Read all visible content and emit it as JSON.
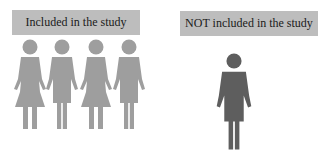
{
  "included": {
    "label": "Included in the study",
    "count": 4,
    "figures": [
      "woman",
      "man",
      "woman",
      "man"
    ],
    "color": "#9e9e9e"
  },
  "not_included": {
    "label": "NOT included in the study",
    "count": 1,
    "figures": [
      "man"
    ],
    "color": "#5e5e5e"
  },
  "label_bg": "#bdbdbd"
}
